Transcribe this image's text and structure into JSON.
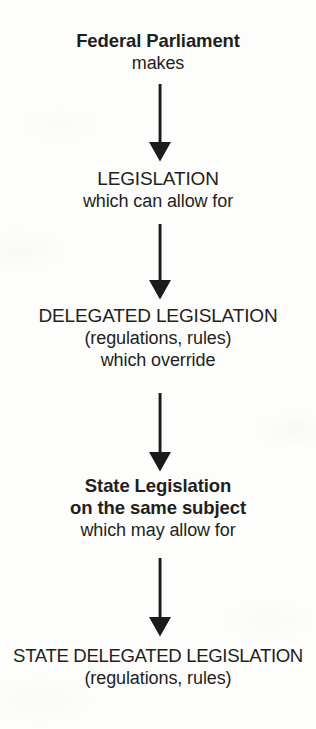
{
  "diagram": {
    "type": "flowchart",
    "orientation": "vertical",
    "background_color": "#fdfdfc",
    "text_color": "#231f20",
    "nodes": [
      {
        "id": "federal-parliament",
        "lines": [
          {
            "text": "Federal Parliament",
            "weight": "bold",
            "case": "mixed"
          },
          {
            "text": "makes",
            "weight": "normal",
            "case": "mixed"
          }
        ]
      },
      {
        "id": "legislation",
        "lines": [
          {
            "text": "LEGISLATION",
            "weight": "normal",
            "case": "upper"
          },
          {
            "text": "which can allow for",
            "weight": "normal",
            "case": "mixed"
          }
        ]
      },
      {
        "id": "delegated-legislation",
        "lines": [
          {
            "text": "DELEGATED LEGISLATION",
            "weight": "normal",
            "case": "upper"
          },
          {
            "text": "(regulations, rules)",
            "weight": "normal",
            "case": "mixed"
          },
          {
            "text": "which override",
            "weight": "normal",
            "case": "mixed"
          }
        ]
      },
      {
        "id": "state-legislation",
        "lines": [
          {
            "text": "State Legislation",
            "weight": "bold",
            "case": "mixed"
          },
          {
            "text": "on the same subject",
            "weight": "bold",
            "case": "mixed"
          },
          {
            "text": "which may allow for",
            "weight": "normal",
            "case": "mixed"
          }
        ]
      },
      {
        "id": "state-delegated-legislation",
        "lines": [
          {
            "text": "STATE DELEGATED LEGISLATION",
            "weight": "normal",
            "case": "upper"
          },
          {
            "text": "(regulations, rules)",
            "weight": "normal",
            "case": "mixed"
          }
        ]
      }
    ],
    "connectors": [
      {
        "id": "arrow-1",
        "from": "federal-parliament",
        "to": "legislation",
        "icon": "down-arrow-icon",
        "label": "makes"
      },
      {
        "id": "arrow-2",
        "from": "legislation",
        "to": "delegated-legislation",
        "icon": "down-arrow-icon",
        "label": "which can allow for"
      },
      {
        "id": "arrow-3",
        "from": "delegated-legislation",
        "to": "state-legislation",
        "icon": "down-arrow-icon",
        "label": "which override"
      },
      {
        "id": "arrow-4",
        "from": "state-legislation",
        "to": "state-delegated-legislation",
        "icon": "down-arrow-icon",
        "label": "which may allow for"
      }
    ]
  }
}
